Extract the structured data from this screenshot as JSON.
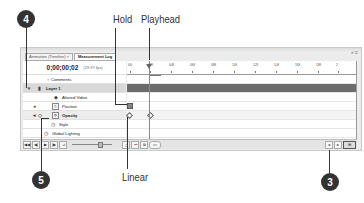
{
  "callouts": {
    "hold": "Hold",
    "playhead": "Playhead",
    "linear": "Linear",
    "badges": [
      "4",
      "5",
      "3"
    ]
  },
  "panel": {
    "tabs": [
      {
        "label": "Animation (Timeline) ×",
        "active": false
      },
      {
        "label": "Measurement Log",
        "active": true
      }
    ],
    "window_controls": "«  ≡",
    "timecode": "0;00;00;02",
    "fps": "(29.97 fps)",
    "ruler_ticks": [
      "00",
      "02f",
      "04f",
      "06f",
      "08f",
      "10f",
      "12f",
      "14f",
      "16f",
      "18f",
      "2"
    ],
    "layers": [
      {
        "name": "Comments",
        "icon": "comments-icon",
        "type": "property"
      },
      {
        "name": "Layer 1",
        "icon": "film-icon",
        "type": "layer"
      },
      {
        "name": "Altered Video",
        "icon": "video-icon",
        "type": "property"
      },
      {
        "name": "Position",
        "icon": "stopwatch-icon",
        "type": "property"
      },
      {
        "name": "Opacity",
        "icon": "stopwatch-icon",
        "type": "property-active"
      },
      {
        "name": "Style",
        "icon": "style-icon",
        "type": "property"
      },
      {
        "name": "Global Lighting",
        "icon": "lighting-icon",
        "type": "property"
      }
    ],
    "bottom_buttons": [
      "◀◀",
      "◀|",
      "▶",
      "|▶",
      "⊿"
    ],
    "bottom_right_buttons": [
      "△",
      "↩",
      "⧉",
      "▭"
    ],
    "scroll_buttons": [
      "◂",
      "▸",
      "⊞"
    ]
  }
}
